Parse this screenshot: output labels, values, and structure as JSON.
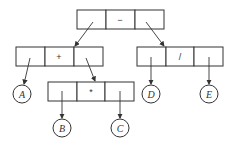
{
  "diagram": {
    "type": "expression-tree",
    "nodes": {
      "root": {
        "op": "−"
      },
      "plus": {
        "op": "+"
      },
      "div": {
        "op": "/"
      },
      "mul": {
        "op": "*"
      }
    },
    "leaves": {
      "A": "A",
      "B": "B",
      "C": "C",
      "D": "D",
      "E": "E"
    }
  }
}
